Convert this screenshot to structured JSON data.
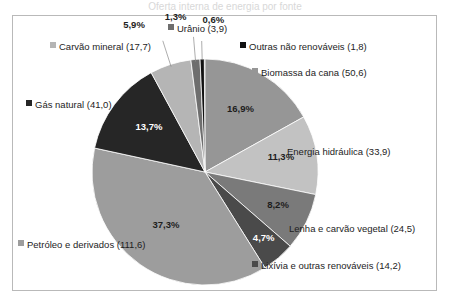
{
  "figure": {
    "title_fragment": "Oferta interna de energia por fonte",
    "frame_border_color": "#b9b9b9",
    "background": "#ffffff"
  },
  "chart_data": {
    "type": "pie",
    "title": "",
    "subtitle": "",
    "xlabel": "",
    "ylabel": "",
    "legend_position": "callout-around-pie",
    "grid": false,
    "unit_note": "values in parentheses are absolute quantities (10^6 tep)",
    "start_angle_deg": 0,
    "direction": "clockwise",
    "categories": [
      "Biomassa da cana",
      "Energia hidráulica",
      "Lenha e carvão vegetal",
      "Lixívia e outras renováveis",
      "Petróleo e derivados",
      "Gás natural",
      "Carvão mineral",
      "Urânio",
      "Outras não renováveis"
    ],
    "values": [
      16.9,
      11.3,
      8.2,
      4.7,
      37.3,
      13.7,
      5.9,
      1.3,
      0.6
    ],
    "absolute_values": [
      50.6,
      33.9,
      24.5,
      14.2,
      111.6,
      41.0,
      17.7,
      3.9,
      1.8
    ],
    "percent_labels": [
      "16,9%",
      "11,3%",
      "8,2%",
      "4,7%",
      "37,3%",
      "13,7%",
      "5,9%",
      "1,3%",
      "0,6%"
    ],
    "colors": [
      "#969696",
      "#c2c2c2",
      "#7a7a7a",
      "#4a4a4a",
      "#9d9d9d",
      "#262626",
      "#b5b5b5",
      "#6e6e6e",
      "#111111"
    ],
    "label_text_colors": [
      "dark",
      "dark",
      "dark",
      "light",
      "dark",
      "light",
      "dark",
      "dark",
      "dark"
    ],
    "legend_entries": [
      {
        "label": "Biomassa da cana (50,6)",
        "color": "#969696"
      },
      {
        "label": "Energia hidráulica (33,9)",
        "color": "#c2c2c2"
      },
      {
        "label": "Lenha e carvão vegetal (24,5)",
        "color": "#7a7a7a"
      },
      {
        "label": "Lixívia e outras renováveis (14,2)",
        "color": "#4a4a4a"
      },
      {
        "label": "Petróleo e derivados (111,6)",
        "color": "#9d9d9d"
      },
      {
        "label": "Gás natural (41,0)",
        "color": "#262626"
      },
      {
        "label": "Carvão mineral (17,7)",
        "color": "#b5b5b5"
      },
      {
        "label": "Urânio (3,9)",
        "color": "#6e6e6e"
      },
      {
        "label": "Outras não renováveis (1,8)",
        "color": "#111111"
      }
    ]
  }
}
